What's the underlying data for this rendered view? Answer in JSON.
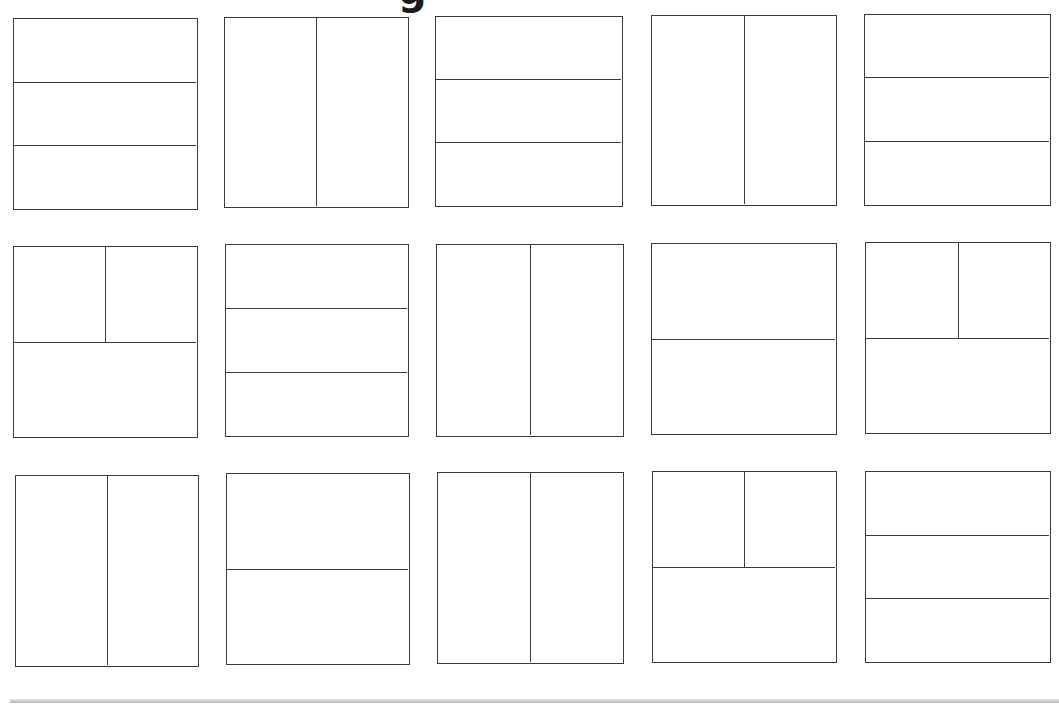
{
  "page": {
    "title_fragment": "g"
  },
  "style": {
    "line_color": "#3a3a3a",
    "background": "#ffffff",
    "bottom_bar_color": "#b9b9b9"
  },
  "layouts": [
    {
      "id": 1,
      "row": 1,
      "col": 1,
      "box": [
        13,
        18,
        185,
        192
      ],
      "type": "three-horizontal-strips",
      "h": [
        0.333,
        0.667
      ],
      "v": []
    },
    {
      "id": 2,
      "row": 1,
      "col": 2,
      "box": [
        224,
        17,
        185,
        191
      ],
      "type": "two-vertical-columns",
      "h": [],
      "v": [
        0.5
      ]
    },
    {
      "id": 3,
      "row": 1,
      "col": 3,
      "box": [
        435,
        16,
        188,
        191
      ],
      "type": "three-horizontal-strips",
      "h": [
        0.33,
        0.665
      ],
      "v": []
    },
    {
      "id": 4,
      "row": 1,
      "col": 4,
      "box": [
        651,
        15,
        186,
        191
      ],
      "type": "two-vertical-columns",
      "h": [],
      "v": [
        0.5
      ]
    },
    {
      "id": 5,
      "row": 1,
      "col": 5,
      "box": [
        864,
        14,
        187,
        192
      ],
      "type": "three-horizontal-strips",
      "h": [
        0.33,
        0.667
      ],
      "v": []
    },
    {
      "id": 6,
      "row": 2,
      "col": 1,
      "box": [
        13,
        246,
        185,
        192
      ],
      "type": "two-top-one-bottom",
      "h": [
        0.5
      ],
      "v_top": [
        0.5
      ]
    },
    {
      "id": 7,
      "row": 2,
      "col": 2,
      "box": [
        225,
        244,
        184,
        193
      ],
      "type": "three-horizontal-strips",
      "h": [
        0.333,
        0.667
      ],
      "v": []
    },
    {
      "id": 8,
      "row": 2,
      "col": 3,
      "box": [
        436,
        244,
        188,
        193
      ],
      "type": "two-vertical-columns",
      "h": [],
      "v": [
        0.5
      ]
    },
    {
      "id": 9,
      "row": 2,
      "col": 4,
      "box": [
        651,
        243,
        186,
        192
      ],
      "type": "two-horizontal-halves",
      "h": [
        0.5
      ],
      "v": []
    },
    {
      "id": 10,
      "row": 2,
      "col": 5,
      "box": [
        865,
        242,
        186,
        192
      ],
      "type": "two-top-one-bottom",
      "h": [
        0.5
      ],
      "v_top": [
        0.5
      ]
    },
    {
      "id": 11,
      "row": 3,
      "col": 1,
      "box": [
        15,
        475,
        184,
        192
      ],
      "type": "two-vertical-columns",
      "h": [],
      "v": [
        0.5
      ]
    },
    {
      "id": 12,
      "row": 3,
      "col": 2,
      "box": [
        226,
        473,
        184,
        192
      ],
      "type": "two-horizontal-halves",
      "h": [
        0.5
      ],
      "v": []
    },
    {
      "id": 13,
      "row": 3,
      "col": 3,
      "box": [
        437,
        472,
        187,
        192
      ],
      "type": "two-vertical-columns",
      "h": [],
      "v": [
        0.5
      ]
    },
    {
      "id": 14,
      "row": 3,
      "col": 4,
      "box": [
        652,
        471,
        185,
        192
      ],
      "type": "two-top-one-bottom",
      "h": [
        0.5
      ],
      "v_top": [
        0.5
      ]
    },
    {
      "id": 15,
      "row": 3,
      "col": 5,
      "box": [
        865,
        471,
        186,
        192
      ],
      "type": "three-horizontal-strips",
      "h": [
        0.333,
        0.667
      ],
      "v": []
    }
  ]
}
